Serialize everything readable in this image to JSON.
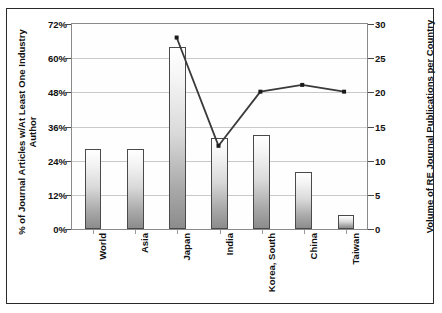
{
  "chart_data": {
    "type": "bar",
    "title": "",
    "subtitle": "",
    "categories": [
      "World",
      "Asia",
      "Japan",
      "India",
      "Korea, South",
      "China",
      "Taiwan"
    ],
    "series": [
      {
        "name": "% of Journal Articles w/At Least One Industry Author",
        "type": "bar",
        "axis": "left",
        "unit": "%",
        "values": [
          28,
          28,
          64,
          32,
          33,
          20,
          5
        ]
      },
      {
        "name": "Volume of RE Journal Publications per Country",
        "type": "line",
        "axis": "right",
        "unit": "publications",
        "x": [
          "Japan",
          "India",
          "Korea, South",
          "China",
          "Taiwan"
        ],
        "values": [
          28,
          12,
          20,
          21,
          20
        ]
      }
    ],
    "xlabel": "",
    "ylabel": "% of Journal Articles w/At Least One Industry Author",
    "y2label": "Volume of RE Journal Publications per Country",
    "ylim": [
      0,
      72
    ],
    "y2lim": [
      0,
      30
    ],
    "yticks": [
      "0%",
      "12%",
      "24%",
      "36%",
      "48%",
      "60%",
      "72%"
    ],
    "ytick_values": [
      0,
      12,
      24,
      36,
      48,
      60,
      72
    ],
    "y2ticks": [
      "0",
      "5",
      "10",
      "15",
      "20",
      "25",
      "30"
    ],
    "y2tick_values": [
      0,
      5,
      10,
      15,
      20,
      25,
      30
    ],
    "grid": true,
    "legend": "none",
    "colors": {
      "bar_fill_top": "#ffffff",
      "bar_fill_bottom": "#8c8c8c",
      "bar_border": "#4a4a4a",
      "line": "#3a3a3a",
      "marker": "#1a1a1a",
      "gridline": "#c9c9c9",
      "frame": "#2a2a2a",
      "text": "#111111",
      "background": "#ffffff"
    }
  }
}
